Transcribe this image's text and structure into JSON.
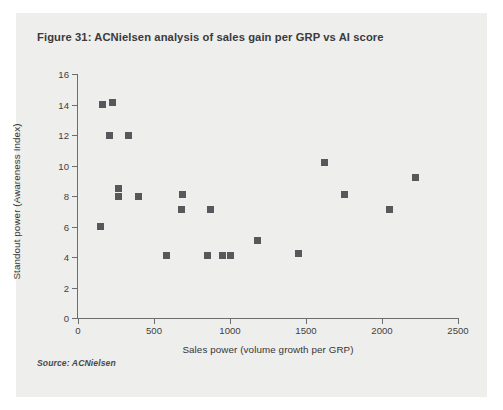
{
  "figure": {
    "title": "Figure 31: ACNielsen analysis of sales gain per GRP vs AI score",
    "source": "Source: ACNielsen",
    "card_background": "#eeeeec",
    "marker_color": "#58585c",
    "axis_color": "#6d6d70"
  },
  "chart_data": {
    "type": "scatter",
    "title": "Figure 31: ACNielsen analysis of sales gain per GRP vs AI score",
    "xlabel": "Sales power (volume growth per GRP)",
    "ylabel": "Standout power (Awareness Index)",
    "xlim": [
      0,
      2500
    ],
    "ylim": [
      0,
      16
    ],
    "xticks": [
      0,
      500,
      1000,
      1500,
      2000,
      2500
    ],
    "yticks": [
      0,
      2,
      4,
      6,
      8,
      10,
      12,
      14,
      16
    ],
    "grid": false,
    "legend": false,
    "marker": "square",
    "series": [
      {
        "name": "Brands",
        "points": [
          [
            160,
            14.0
          ],
          [
            225,
            14.1
          ],
          [
            210,
            12.0
          ],
          [
            330,
            12.0
          ],
          [
            150,
            6.0
          ],
          [
            265,
            8.5
          ],
          [
            265,
            8.0
          ],
          [
            395,
            8.0
          ],
          [
            580,
            4.1
          ],
          [
            690,
            8.1
          ],
          [
            680,
            7.1
          ],
          [
            870,
            7.1
          ],
          [
            850,
            4.1
          ],
          [
            950,
            4.1
          ],
          [
            1000,
            4.1
          ],
          [
            1180,
            5.1
          ],
          [
            1450,
            4.2
          ],
          [
            1620,
            10.2
          ],
          [
            1750,
            8.1
          ],
          [
            2050,
            7.1
          ],
          [
            2220,
            9.2
          ]
        ]
      }
    ]
  }
}
